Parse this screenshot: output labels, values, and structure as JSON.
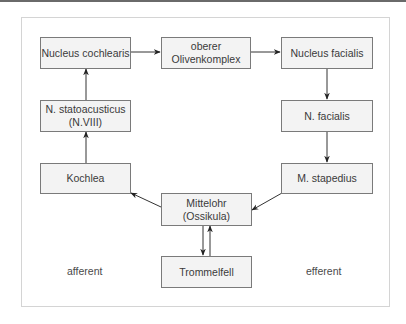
{
  "diagram": {
    "nodes": {
      "nucleus_cochlearis": "Nucleus cochlearis",
      "oberer_olivenkomplex": "oberer\nOlivenkomplex",
      "nucleus_facialis": "Nucleus facialis",
      "n_statoacusticus": "N. statoacusticus\n(N.VIII)",
      "n_facialis": "N. facialis",
      "kochlea": "Kochlea",
      "m_stapedius": "M. stapedius",
      "mittelohr": "Mittelohr\n(Ossikula)",
      "trommelfell": "Trommelfell"
    },
    "labels": {
      "afferent": "afferent",
      "efferent": "efferent"
    },
    "edges": [
      {
        "from": "Nucleus cochlearis",
        "to": "oberer Olivenkomplex"
      },
      {
        "from": "oberer Olivenkomplex",
        "to": "Nucleus facialis"
      },
      {
        "from": "Nucleus facialis",
        "to": "N. facialis"
      },
      {
        "from": "N. facialis",
        "to": "M. stapedius"
      },
      {
        "from": "M. stapedius",
        "to": "Mittelohr (Ossikula)"
      },
      {
        "from": "Mittelohr (Ossikula)",
        "to": "Kochlea"
      },
      {
        "from": "Kochlea",
        "to": "N. statoacusticus (N.VIII)"
      },
      {
        "from": "N. statoacusticus (N.VIII)",
        "to": "Nucleus cochlearis"
      },
      {
        "from": "Mittelohr (Ossikula)",
        "to": "Trommelfell"
      },
      {
        "from": "Trommelfell",
        "to": "Mittelohr (Ossikula)"
      }
    ],
    "colors": {
      "box_fill": "#f3f3f3",
      "box_border": "#7a7a7a",
      "arrow": "#222222"
    }
  }
}
